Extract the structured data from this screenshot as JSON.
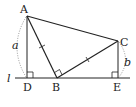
{
  "diagram": {
    "type": "geometry",
    "colors": {
      "line": "#222222",
      "dotted": "#888888",
      "background": "#ffffff"
    },
    "points": {
      "A": {
        "label": "A",
        "x": 27,
        "y": 16
      },
      "B": {
        "label": "B",
        "x": 57,
        "y": 78
      },
      "C": {
        "label": "C",
        "x": 118,
        "y": 41
      },
      "D": {
        "label": "D",
        "x": 27,
        "y": 78
      },
      "E": {
        "label": "E",
        "x": 118,
        "y": 78
      }
    },
    "line_label": "l",
    "lengths": {
      "AD": "a",
      "CE": "b"
    },
    "markers": {
      "right_angles": [
        "D",
        "B",
        "E"
      ],
      "equal_ticks": [
        "AB",
        "BC"
      ]
    }
  }
}
